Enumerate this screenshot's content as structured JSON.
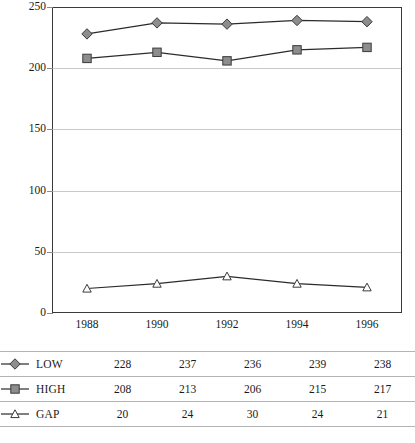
{
  "chart_data": {
    "type": "line",
    "title": "",
    "xlabel": "",
    "ylabel": "",
    "x": [
      1988,
      1990,
      1992,
      1994,
      1996
    ],
    "categories": [
      "1988",
      "1990",
      "1992",
      "1994",
      "1996"
    ],
    "ylim": [
      0,
      250
    ],
    "yticks": [
      0,
      50,
      100,
      150,
      200,
      250
    ],
    "ytick_labels": [
      "0",
      "50",
      "100",
      "150",
      "200",
      "250"
    ],
    "grid": "horizontal",
    "legend_position": "table-below",
    "series": [
      {
        "name": "LOW",
        "marker": "diamond",
        "values": [
          228,
          237,
          236,
          239,
          238
        ]
      },
      {
        "name": "HIGH",
        "marker": "square",
        "values": [
          208,
          213,
          206,
          215,
          217
        ]
      },
      {
        "name": "GAP",
        "marker": "triangle",
        "values": [
          20,
          24,
          30,
          24,
          21
        ]
      }
    ]
  },
  "colors": {
    "line": "#2b2b2b",
    "marker_fill": "#8d8d8d",
    "marker_open_fill": "#ffffff",
    "marker_stroke": "#3a3a3c",
    "grid": "#c9c9c9",
    "axis": "#3a3a3c",
    "text": "#1a1a1a",
    "table_rule": "#b4b4b4"
  },
  "table": {
    "rows": [
      {
        "name": "LOW",
        "marker": "diamond-marker-icon",
        "values": [
          "228",
          "237",
          "236",
          "239",
          "238"
        ]
      },
      {
        "name": "HIGH",
        "marker": "square-marker-icon",
        "values": [
          "208",
          "213",
          "206",
          "215",
          "217"
        ]
      },
      {
        "name": "GAP",
        "marker": "triangle-marker-icon",
        "values": [
          "20",
          "24",
          "30",
          "24",
          "21"
        ]
      }
    ]
  },
  "footer": {
    "cropped_text": ""
  }
}
